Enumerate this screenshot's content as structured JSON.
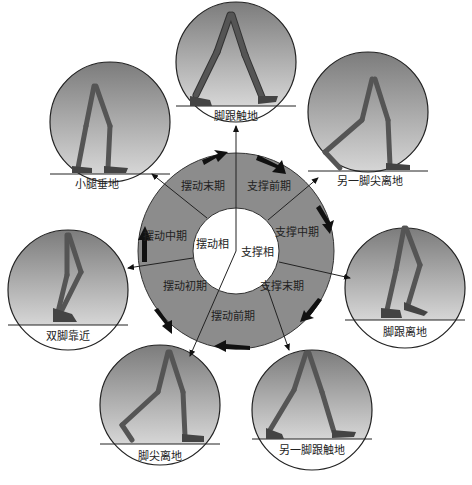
{
  "diagram": {
    "center": {
      "swing_phase": "摆动相",
      "stance_phase": "支撑相"
    },
    "ring_segments": [
      {
        "label": "支撑前期",
        "x": 269,
        "y": 190
      },
      {
        "label": "支撑中期",
        "x": 297,
        "y": 236
      },
      {
        "label": "支撑末期",
        "x": 282,
        "y": 290
      },
      {
        "label": "摆动前期",
        "x": 233,
        "y": 320
      },
      {
        "label": "摆动初期",
        "x": 185,
        "y": 290
      },
      {
        "label": "摆动中期",
        "x": 165,
        "y": 240
      },
      {
        "label": "摆动末期",
        "x": 203,
        "y": 190
      }
    ],
    "poses": [
      {
        "id": "heel-strike",
        "label": "脚跟触地",
        "cx": 236,
        "cy": 62
      },
      {
        "id": "opposite-toe-off",
        "label": "另一脚尖离地",
        "cx": 368,
        "cy": 112
      },
      {
        "id": "heel-off",
        "label": "脚跟离地",
        "cx": 405,
        "cy": 288
      },
      {
        "id": "opposite-heel-strike",
        "label": "另一脚跟触地",
        "cx": 312,
        "cy": 410
      },
      {
        "id": "toe-off",
        "label": "脚尖离地",
        "cx": 160,
        "cy": 405
      },
      {
        "id": "feet-adjacent",
        "label": "双脚靠近",
        "cx": 68,
        "cy": 290
      },
      {
        "id": "tibia-vertical",
        "label": "小腿垂地",
        "cx": 110,
        "cy": 122
      }
    ],
    "colors": {
      "ring": "#8c8c8c",
      "inner": "#ffffff",
      "circle_top": "#7a7a7a",
      "circle_bottom": "#d4d4d4",
      "leg": "#4a4a4a",
      "arrow": "#111111"
    }
  }
}
